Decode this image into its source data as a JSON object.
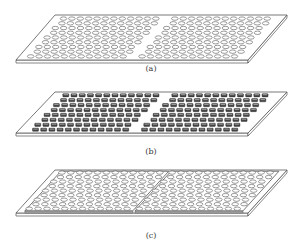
{
  "figure": {
    "panels": [
      {
        "id": "a",
        "label": "(a)",
        "label_pos": [
          151,
          70
        ],
        "plate": {
          "top_left": [
            55,
            15
          ],
          "top_right": [
            287,
            15
          ],
          "bottom_right": [
            248,
            60
          ],
          "bottom_left": [
            16,
            60
          ],
          "thickness": 3
        },
        "hole_shape": "ellipse",
        "raised_panels": false,
        "groups": [
          {
            "u0": 0.05,
            "u1": 0.47,
            "v0": 0.08,
            "v1": 0.92,
            "cols": 12,
            "rows": 9
          },
          {
            "u0": 0.53,
            "u1": 0.95,
            "v0": 0.08,
            "v1": 0.92,
            "cols": 12,
            "rows": 9
          }
        ]
      },
      {
        "id": "b",
        "label": "(b)",
        "label_pos": [
          151,
          153
        ],
        "plate": {
          "top_left": [
            55,
            92
          ],
          "top_right": [
            287,
            92
          ],
          "bottom_right": [
            248,
            133
          ],
          "bottom_left": [
            16,
            133
          ],
          "thickness": 3
        },
        "hole_shape": "square",
        "raised_panels": false,
        "groups": [
          {
            "u0": 0.06,
            "u1": 0.47,
            "v0": 0.08,
            "v1": 0.92,
            "cols": 12,
            "rows": 8
          },
          {
            "u0": 0.53,
            "u1": 0.94,
            "v0": 0.08,
            "v1": 0.92,
            "cols": 12,
            "rows": 8
          }
        ]
      },
      {
        "id": "c",
        "label": "(c)",
        "label_pos": [
          151,
          237
        ],
        "plate": {
          "top_left": [
            55,
            170
          ],
          "top_right": [
            287,
            170
          ],
          "bottom_right": [
            248,
            213
          ],
          "bottom_left": [
            16,
            213
          ],
          "thickness": 3
        },
        "hole_shape": "ellipse",
        "raised_panels": true,
        "groups": [
          {
            "u0": 0.04,
            "u1": 0.485,
            "v0": 0.06,
            "v1": 0.9,
            "cols": 12,
            "rows": 9
          },
          {
            "u0": 0.515,
            "u1": 0.96,
            "v0": 0.06,
            "v1": 0.9,
            "cols": 12,
            "rows": 9
          }
        ]
      }
    ],
    "colors": {
      "stroke": "#555555",
      "fill": "#ffffff",
      "hole_fill": "#ffffff",
      "square_fill": "#444444",
      "panel_edge": "#888888"
    }
  }
}
